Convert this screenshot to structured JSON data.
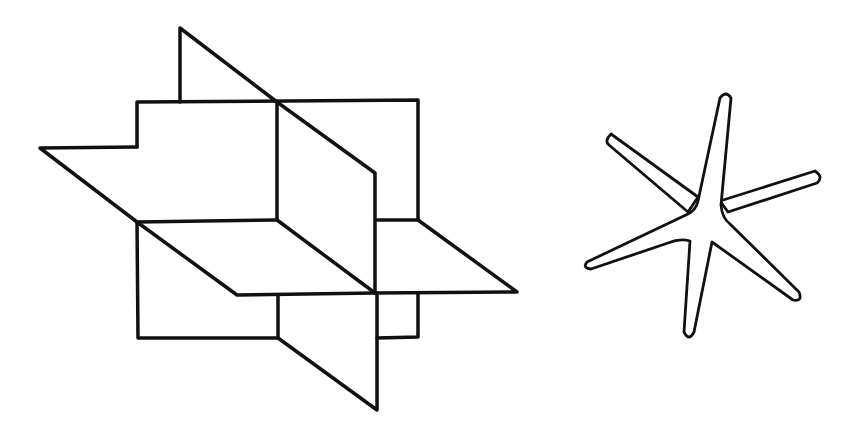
{
  "figure": {
    "background": "#ffffff",
    "stroke_color": "#111111",
    "left_figure": {
      "name": "three-intersecting-planes",
      "description": "Three mutually perpendicular planes intersecting at a common point"
    },
    "right_figure": {
      "name": "six-armed-star",
      "description": "Six-armed star shape (three intersecting axes)",
      "arm_count": 6
    }
  }
}
